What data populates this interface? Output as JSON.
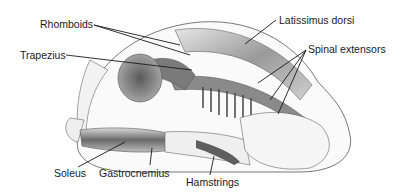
{
  "figure": {
    "labels": {
      "rhomboids": "Rhomboids",
      "trapezius": "Trapezius",
      "latissimus_dorsi": "Latissimus dorsi",
      "spinal_extensors": "Spinal extensors",
      "soleus": "Soleus",
      "gastrocnemius": "Gastrocnemius",
      "hamstrings": "Hamstrings"
    },
    "colors": {
      "line": "#1a1a1a",
      "outline": "#555555",
      "muscle_dark": "#6a6a6a",
      "muscle_mid": "#a8a8a8",
      "muscle_light": "#d4d4d4"
    }
  }
}
